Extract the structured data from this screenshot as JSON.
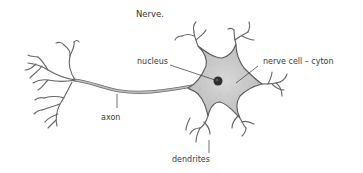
{
  "diagram": {
    "title": "Nerve.",
    "labels": {
      "nucleus": "nucleus",
      "cyton": "nerve cell – cyton",
      "axon": "axon",
      "dendrites": "dendrites"
    },
    "colors": {
      "outline": "#555555",
      "cell_fill": "#cfcfcf",
      "nucleus": "#333333",
      "text": "#3a3a3a",
      "background": "#ffffff"
    }
  }
}
